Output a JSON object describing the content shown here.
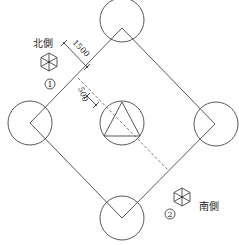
{
  "diagram": {
    "type": "plan layout",
    "square": {
      "vertices": {
        "top": [
          122,
          28
        ],
        "right": [
          215,
          124
        ],
        "bottom": [
          122,
          218
        ],
        "left": [
          30,
          123
        ]
      }
    },
    "circles": {
      "top": {
        "cx": 122,
        "cy": 20,
        "r": 22,
        "hatched": true
      },
      "bottom": {
        "cx": 122,
        "cy": 218,
        "r": 22,
        "hatched": true
      },
      "left": {
        "cx": 30,
        "cy": 123,
        "r": 22,
        "hatched": false
      },
      "right": {
        "cx": 216,
        "cy": 124,
        "r": 22,
        "hatched": false
      },
      "center": {
        "cx": 122,
        "cy": 123,
        "r": 22,
        "hatched": false,
        "inner_symbol": "triangle"
      }
    },
    "dimensions": [
      {
        "label": "1500",
        "description": "offset from square edge"
      },
      {
        "label": "500",
        "description": "offset to dashed line"
      }
    ],
    "markers": [
      {
        "number": "①",
        "label": "北側",
        "icon": "hexagon-marker-icon"
      },
      {
        "number": "②",
        "label": "南側",
        "icon": "hexagon-marker-icon"
      }
    ]
  },
  "labels": {
    "north_side": "北側",
    "south_side": "南側",
    "marker_1": "1",
    "marker_2": "2",
    "dim_1500": "1500",
    "dim_500": "500"
  }
}
